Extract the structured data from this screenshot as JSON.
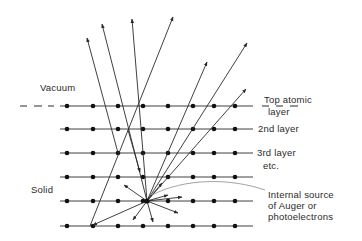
{
  "labels": {
    "vacuum": "Vacuum",
    "solid": "Solid",
    "top_layer_line1": "Top atomic",
    "top_layer_line2": "layer",
    "second_layer": "2nd layer",
    "third_layer_line1": "3rd layer",
    "third_layer_line2": "etc.",
    "source_line1": "Internal  source",
    "source_line2": "of Auger  or",
    "source_line3": "photoelectrons"
  },
  "lattice": {
    "rows_y": [
      106,
      129,
      153,
      177,
      201,
      226
    ],
    "dots_x": [
      67,
      93,
      118,
      143,
      168,
      193,
      214,
      235
    ],
    "line_x_start": 60,
    "line_x_end": 253
  },
  "source_point": [
    147,
    201
  ],
  "colors": {
    "ink": "#2a2a2a",
    "leader": "#8a8a8a",
    "background": "#ffffff"
  }
}
